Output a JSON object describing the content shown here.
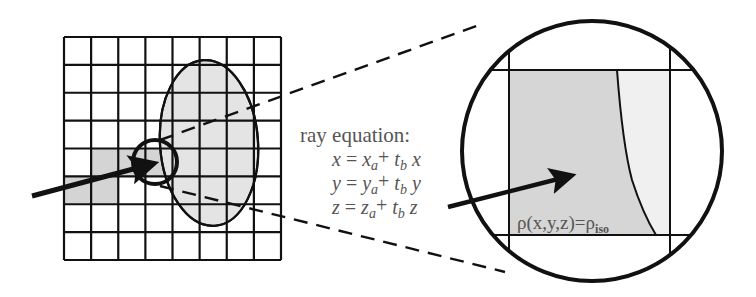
{
  "colors": {
    "stroke": "#111111",
    "shade_dark": "#d4d4d4",
    "shade_light": "#e4e4e4",
    "text": "#555555",
    "background": "#ffffff"
  },
  "grid": {
    "columns": 8,
    "rows": 8,
    "shaded_cells": [
      {
        "row": 4,
        "col": 1
      },
      {
        "row": 4,
        "col": 2
      },
      {
        "row": 4,
        "col": 3
      },
      {
        "row": 5,
        "col": 0
      },
      {
        "row": 5,
        "col": 1
      }
    ]
  },
  "equation": {
    "heading": "ray equation:",
    "lines": [
      {
        "lhs": "x",
        "eq": " = ",
        "var": "x",
        "sub": "a",
        "plus": "+ ",
        "t": "t",
        "tsub": "b",
        "dir": " x"
      },
      {
        "lhs": "y",
        "eq": " = ",
        "var": "y",
        "sub": "a",
        "plus": "+ ",
        "t": "t",
        "tsub": "b",
        "dir": " y"
      },
      {
        "lhs": "z",
        "eq": " = ",
        "var": "z",
        "sub": "a",
        "plus": "+ ",
        "t": "t",
        "tsub": "b",
        "dir": " z"
      }
    ]
  },
  "isosurface_label": {
    "main": "ρ(x,y,z)=ρ",
    "sub": "iso"
  },
  "icons": {
    "ray_arrow": "arrow-right-icon",
    "magnifier": "zoom-circle-icon"
  }
}
